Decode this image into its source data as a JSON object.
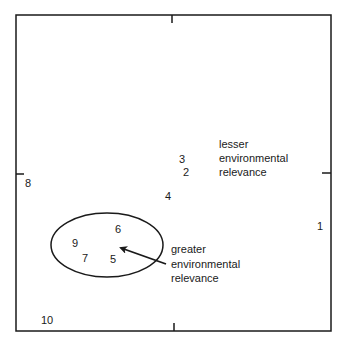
{
  "diagram": {
    "type": "ordination-plot",
    "frame": {
      "x0": 16,
      "y0": 15,
      "x1": 331,
      "y1": 331,
      "stroke": "#1a1a1a"
    },
    "ticks": [
      {
        "side": "top",
        "pos": 172
      },
      {
        "side": "bottom",
        "pos": 174
      },
      {
        "side": "left",
        "pos": 174
      },
      {
        "side": "right",
        "pos": 173
      }
    ],
    "points": [
      {
        "label": "1",
        "x": 320,
        "y": 230
      },
      {
        "label": "2",
        "x": 186,
        "y": 176
      },
      {
        "label": "3",
        "x": 182,
        "y": 163
      },
      {
        "label": "4",
        "x": 168,
        "y": 200
      },
      {
        "label": "5",
        "x": 113,
        "y": 263
      },
      {
        "label": "6",
        "x": 118,
        "y": 233
      },
      {
        "label": "7",
        "x": 85,
        "y": 262
      },
      {
        "label": "8",
        "x": 28,
        "y": 187
      },
      {
        "label": "9",
        "x": 75,
        "y": 247
      },
      {
        "label": "10",
        "x": 47,
        "y": 324
      }
    ],
    "ellipse": {
      "cx": 107,
      "cy": 245,
      "rx": 56,
      "ry": 32
    },
    "arrow": {
      "x1": 166,
      "y1": 264,
      "x2": 120,
      "y2": 248
    },
    "annotations": {
      "lesser": {
        "lines": [
          "lesser",
          "environmental",
          "relevance"
        ],
        "x": 219,
        "y": 148
      },
      "greater": {
        "lines": [
          "greater",
          "environmental",
          "relevance"
        ],
        "x": 171,
        "y": 253
      }
    }
  }
}
